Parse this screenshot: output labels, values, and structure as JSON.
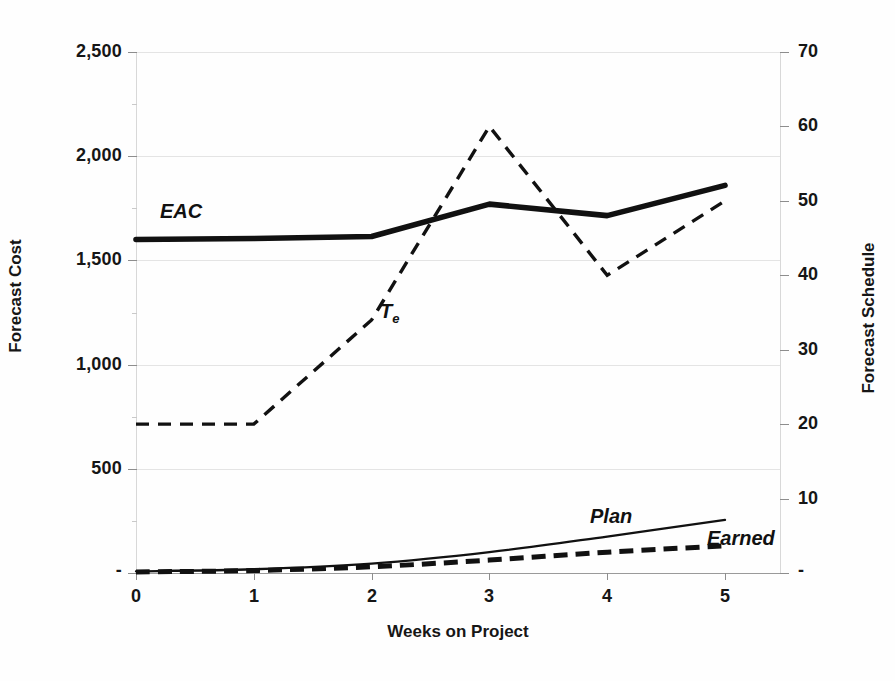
{
  "chart_data": {
    "type": "line",
    "title": "",
    "xlabel": "Weeks on Project",
    "ylabel": "Forecast Cost",
    "y2label": "Forecast Schedule",
    "x": [
      0,
      1,
      2,
      3,
      4,
      5
    ],
    "xtick_labels": [
      "0",
      "1",
      "2",
      "3",
      "4",
      "5"
    ],
    "xlim": [
      0,
      5
    ],
    "ylim": [
      0,
      2500
    ],
    "ytick_labels": [
      "-",
      "500",
      "1,000",
      "1,500",
      "2,000",
      "2,500"
    ],
    "ytick_values": [
      0,
      500,
      1000,
      1500,
      2000,
      2500
    ],
    "y2lim": [
      0,
      70
    ],
    "y2tick_labels": [
      "-",
      "10",
      "20",
      "30",
      "40",
      "50",
      "60",
      "70"
    ],
    "y2tick_values": [
      0,
      10,
      20,
      30,
      40,
      50,
      60,
      70
    ],
    "grid": true,
    "legend_position": "inline-annotations",
    "series": [
      {
        "name": "EAC",
        "axis": "left",
        "style": "solid",
        "width": "thick",
        "color": "#111111",
        "values": [
          1600,
          1605,
          1615,
          1770,
          1715,
          1860
        ],
        "label_text": "EAC"
      },
      {
        "name": "Te",
        "axis": "right",
        "style": "dashed",
        "width": "medium",
        "color": "#111111",
        "values": [
          20,
          20,
          34,
          60,
          40,
          50
        ],
        "label_text": "T",
        "label_sub": "e"
      },
      {
        "name": "Plan",
        "axis": "left",
        "style": "solid",
        "width": "thin",
        "color": "#111111",
        "values": [
          8,
          18,
          45,
          100,
          175,
          255
        ],
        "label_text": "Plan"
      },
      {
        "name": "Earned",
        "axis": "left",
        "style": "dashed",
        "width": "thick",
        "color": "#111111",
        "values": [
          5,
          12,
          30,
          62,
          100,
          130
        ],
        "label_text": "Earned"
      }
    ]
  },
  "axes": {
    "left_title": "Forecast Cost",
    "right_title": "Forecast Schedule",
    "x_title": "Weeks on Project"
  },
  "ticks": {
    "left": [
      "2,500",
      "2,000",
      "1,500",
      "1,000",
      "500",
      "-"
    ],
    "right": [
      "70",
      "60",
      "50",
      "40",
      "30",
      "20",
      "10",
      "-"
    ],
    "x": [
      "0",
      "1",
      "2",
      "3",
      "4",
      "5"
    ]
  },
  "annotations": {
    "eac": "EAC",
    "te_base": "T",
    "te_sub": "e",
    "plan": "Plan",
    "earned": "Earned"
  }
}
